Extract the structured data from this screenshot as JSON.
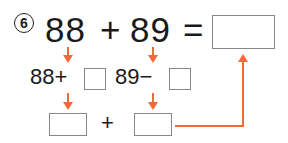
{
  "problem": {
    "number_label": "6",
    "equation": {
      "operand1": "88",
      "operator": "+",
      "operand2": "89",
      "equals": "="
    },
    "step1": {
      "left_expr": "88+",
      "right_expr": "89−"
    },
    "step2": {
      "plus": "+"
    }
  },
  "colors": {
    "arrow": "#f26a3a",
    "text": "#1a1a1a",
    "box_border": "#888888"
  }
}
